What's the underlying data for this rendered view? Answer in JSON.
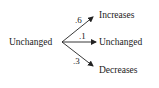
{
  "diagram": {
    "type": "probability-tree",
    "source": {
      "label": "Unchanged"
    },
    "branches": [
      {
        "probability": ".6",
        "target": "Increases"
      },
      {
        "probability": ".1",
        "target": "Unchanged"
      },
      {
        "probability": ".3",
        "target": "Decreases"
      }
    ],
    "colors": {
      "text": "#1a1a1a",
      "arrow": "#222222",
      "background": "#ffffff"
    }
  }
}
